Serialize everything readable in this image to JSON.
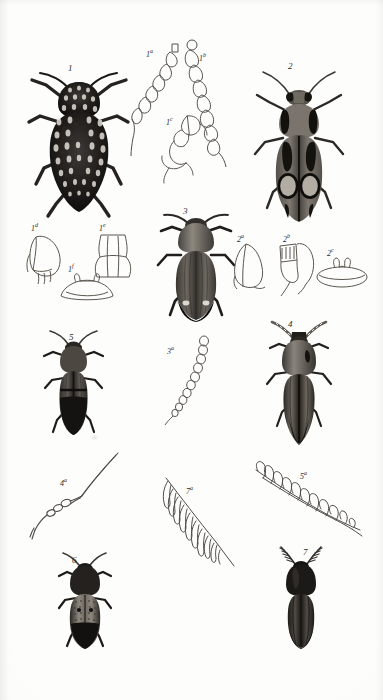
{
  "plate": {
    "title": "Coleoptera plate",
    "background_color": "#fdfdfc",
    "ink_color": "#2e2c29",
    "figures": [
      {
        "id": "fig-1",
        "label": "1",
        "kind": "beetle-habitus",
        "description": "Broad oval dark beetle densely covered with pale speckles, short legs, moderate antennae",
        "tone": "very-dark",
        "x": 78,
        "y": 66
      },
      {
        "id": "fig-1a",
        "label": "1",
        "sup": "a",
        "kind": "antenna-detail",
        "description": "Serrate antenna, outline only, leaning right",
        "tone": "outline",
        "x": 150,
        "y": 50
      },
      {
        "id": "fig-1b",
        "label": "1",
        "sup": "b",
        "kind": "antenna-detail",
        "description": "Serrate antenna, outline only, leaning left",
        "tone": "outline",
        "x": 203,
        "y": 56
      },
      {
        "id": "fig-1c",
        "label": "1",
        "sup": "c",
        "kind": "leg-detail",
        "description": "Curved tarsus and tibia outline sketch",
        "tone": "outline",
        "x": 172,
        "y": 120
      },
      {
        "id": "fig-2",
        "label": "2",
        "kind": "beetle-habitus",
        "description": "Elongate beetle, dark with two large pale oval elytral patches and pale pronotal sides",
        "tone": "dark-patterned",
        "x": 297,
        "y": 72
      },
      {
        "id": "fig-1d",
        "label": "1",
        "sup": "d",
        "kind": "mouthpart-detail",
        "description": "Mandible / maxilla outline sketch, left of plate middle",
        "tone": "outline",
        "x": 43,
        "y": 252
      },
      {
        "id": "fig-1e",
        "label": "1",
        "sup": "e",
        "kind": "prosternum-detail",
        "description": "Prosternal plate outline, waisted shape",
        "tone": "outline",
        "x": 110,
        "y": 250
      },
      {
        "id": "fig-1f",
        "label": "1",
        "sup": "f",
        "kind": "coxal-plate-detail",
        "description": "Low broad coxal plate outline with two small prongs on top",
        "tone": "outline",
        "x": 77,
        "y": 283
      },
      {
        "id": "fig-3",
        "label": "3",
        "kind": "beetle-habitus",
        "description": "Robust click beetle, dark grey elytra with fine striae and two pale apical spots",
        "tone": "dark",
        "x": 192,
        "y": 215
      },
      {
        "id": "fig-2a",
        "label": "2",
        "sup": "a",
        "kind": "prosternum-detail",
        "description": "Rounded prosternal outline sketch",
        "tone": "outline",
        "x": 246,
        "y": 258
      },
      {
        "id": "fig-2b",
        "label": "2",
        "sup": "b",
        "kind": "mouthpart-detail",
        "description": "Hooked outline sketch with ribbed segment, curved tail",
        "tone": "outline",
        "x": 291,
        "y": 258
      },
      {
        "id": "fig-2c",
        "label": "2",
        "sup": "c",
        "kind": "coxal-plate-detail",
        "description": "Flat disc outline with small paired prongs on top",
        "tone": "outline",
        "x": 339,
        "y": 272
      },
      {
        "id": "fig-5",
        "label": "5",
        "kind": "beetle-habitus",
        "description": "Slender parallel-sided dark beetle, short serrate antennae",
        "tone": "dark",
        "x": 72,
        "y": 340
      },
      {
        "id": "fig-3a",
        "label": "3",
        "sup": "a",
        "kind": "antenna-detail",
        "description": "Moniliform / weakly serrate antenna outline, curving",
        "tone": "outline",
        "x": 186,
        "y": 345
      },
      {
        "id": "fig-4",
        "label": "4",
        "kind": "beetle-habitus",
        "description": "Very elongate click beetle, tapering elytra, pale flecked antennae",
        "tone": "mid-dark",
        "x": 297,
        "y": 330
      },
      {
        "id": "fig-4a",
        "label": "4",
        "sup": "a",
        "kind": "antenna-detail",
        "description": "Long filiform antenna outline with bent basal segments",
        "tone": "outline",
        "x": 80,
        "y": 473
      },
      {
        "id": "fig-7a",
        "label": "7",
        "sup": "a",
        "kind": "antenna-detail",
        "description": "Strongly pectinate antenna outline, diagonal",
        "tone": "outline",
        "x": 198,
        "y": 485
      },
      {
        "id": "fig-5a",
        "label": "5",
        "sup": "a",
        "kind": "antenna-detail",
        "description": "Strongly pectinate / flabellate antenna outline, diagonal, larger rami",
        "tone": "outline",
        "x": 310,
        "y": 470
      },
      {
        "id": "fig-6",
        "label": "6",
        "kind": "beetle-habitus",
        "description": "Short stout dark beetle, granulate pale-dotted elytral base",
        "tone": "very-dark",
        "x": 79,
        "y": 560
      },
      {
        "id": "fig-7",
        "label": "7",
        "kind": "beetle-habitus",
        "description": "Elongate dark click beetle with conspicuous pectinate antennae",
        "tone": "very-dark",
        "x": 298,
        "y": 552
      }
    ]
  }
}
